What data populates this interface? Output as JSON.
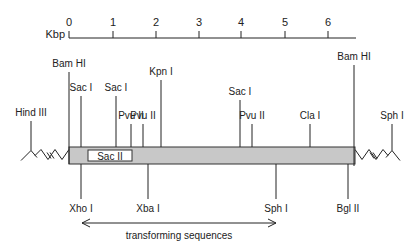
{
  "scale": {
    "unit_label": "Kbp",
    "ticks": [
      "0",
      "1",
      "2",
      "3",
      "4",
      "5",
      "6"
    ],
    "tick_x": [
      69,
      113,
      156,
      199,
      241,
      285,
      328
    ],
    "axis_start_x": 69,
    "axis_end_x": 356,
    "axis_y": 38
  },
  "insert": {
    "x1": 69,
    "x2": 355,
    "y1": 147,
    "y2": 164,
    "fill": "#c8c8c8",
    "inner_box": {
      "label": "Sac II",
      "x1": 88,
      "x2": 132
    }
  },
  "flanks": {
    "left": {
      "label": "Hind III",
      "x": 31
    },
    "right": {
      "label": "Sph I",
      "x": 392
    }
  },
  "sites_above": [
    {
      "label": "Bam HI",
      "x": 69,
      "top": 72
    },
    {
      "label": "Sac I",
      "x": 81,
      "top": 96
    },
    {
      "label": "Sac I",
      "x": 116,
      "top": 96
    },
    {
      "label": "Pvu II",
      "x": 131,
      "top": 124
    },
    {
      "label": "Pvu II",
      "x": 143,
      "top": 124
    },
    {
      "label": "Kpn I",
      "x": 161,
      "top": 80
    },
    {
      "label": "Sac I",
      "x": 240,
      "top": 100
    },
    {
      "label": "Pvu II",
      "x": 252,
      "top": 124
    },
    {
      "label": "Cla I",
      "x": 310,
      "top": 124
    },
    {
      "label": "Bam HI",
      "x": 354,
      "top": 65
    }
  ],
  "sites_below": [
    {
      "label": "Xho I",
      "x": 81
    },
    {
      "label": "Xba I",
      "x": 148
    },
    {
      "label": "Sph I",
      "x": 276
    },
    {
      "label": "Bgl II",
      "x": 348
    }
  ],
  "transforming": {
    "label": "transforming sequences",
    "x1": 82,
    "x2": 276,
    "y": 223
  }
}
